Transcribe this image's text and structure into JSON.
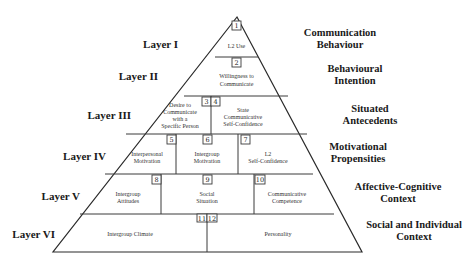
{
  "diagram": {
    "type": "pyramid",
    "layers": [
      {
        "label": "Layer I",
        "category_lines": [
          "Communication",
          "Behaviour"
        ],
        "cells": [
          {
            "num": "1",
            "text_lines": [
              "L2 Use"
            ]
          }
        ]
      },
      {
        "label": "Layer II",
        "category_lines": [
          "Behavioural",
          "Intention"
        ],
        "cells": [
          {
            "num": "2",
            "text_lines": [
              "Willingness to",
              "Communicate"
            ]
          }
        ]
      },
      {
        "label": "Layer III",
        "category_lines": [
          "Situated",
          "Antecedents"
        ],
        "cells": [
          {
            "num": "3",
            "text_lines": [
              "Desire to",
              "Communicate",
              "with a",
              "Specific Person"
            ]
          },
          {
            "num": "4",
            "text_lines": [
              "State",
              "Communicative",
              "Self-Confidence"
            ]
          }
        ]
      },
      {
        "label": "Layer IV",
        "category_lines": [
          "Motivational",
          "Propensities"
        ],
        "cells": [
          {
            "num": "5",
            "text_lines": [
              "Interpersonal",
              "Motivation"
            ]
          },
          {
            "num": "6",
            "text_lines": [
              "Intergroup",
              "Motivation"
            ]
          },
          {
            "num": "7",
            "text_lines": [
              "L2",
              "Self-Confidence"
            ]
          }
        ]
      },
      {
        "label": "Layer V",
        "category_lines": [
          "Affective-Cognitive",
          "Context"
        ],
        "cells": [
          {
            "num": "8",
            "text_lines": [
              "Intergroup",
              "Attitudes"
            ]
          },
          {
            "num": "9",
            "text_lines": [
              "Social",
              "Situation"
            ]
          },
          {
            "num": "10",
            "text_lines": [
              "Communicative",
              "Competence"
            ]
          }
        ]
      },
      {
        "label": "Layer VI",
        "category_lines": [
          "Social and Individual",
          "Context"
        ],
        "cells": [
          {
            "num": "11",
            "text_lines": [
              "Intergroup Climate"
            ]
          },
          {
            "num": "12",
            "text_lines": [
              "Personality"
            ]
          }
        ]
      }
    ]
  }
}
